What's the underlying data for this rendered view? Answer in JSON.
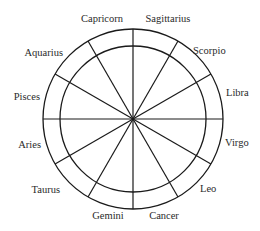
{
  "diagram": {
    "type": "zodiac-wheel",
    "center": [
      133,
      119
    ],
    "outer_radius": 90,
    "inner_radius": 73,
    "stroke_color": "#1a1a1a",
    "text_color": "#2a2a2a",
    "signs": [
      {
        "label": "Sagittarius",
        "x": 168,
        "y": 22,
        "anchor": "middle"
      },
      {
        "label": "Scorpio",
        "x": 193,
        "y": 54,
        "anchor": "start"
      },
      {
        "label": "Libra",
        "x": 226,
        "y": 96,
        "anchor": "start"
      },
      {
        "label": "Virgo",
        "x": 225,
        "y": 146,
        "anchor": "start"
      },
      {
        "label": "Leo",
        "x": 200,
        "y": 192,
        "anchor": "start"
      },
      {
        "label": "Cancer",
        "x": 164,
        "y": 219,
        "anchor": "middle"
      },
      {
        "label": "Gemini",
        "x": 108,
        "y": 219,
        "anchor": "middle"
      },
      {
        "label": "Taurus",
        "x": 60,
        "y": 193,
        "anchor": "end"
      },
      {
        "label": "Aries",
        "x": 41,
        "y": 148,
        "anchor": "end"
      },
      {
        "label": "Pisces",
        "x": 40,
        "y": 100,
        "anchor": "end"
      },
      {
        "label": "Aquarius",
        "x": 63,
        "y": 56,
        "anchor": "end"
      },
      {
        "label": "Capricorn",
        "x": 102,
        "y": 22,
        "anchor": "middle"
      }
    ],
    "spoke_angles_deg": [
      90,
      60,
      30,
      0,
      -30,
      -60,
      -90,
      -120,
      -150,
      180,
      150,
      120
    ]
  }
}
